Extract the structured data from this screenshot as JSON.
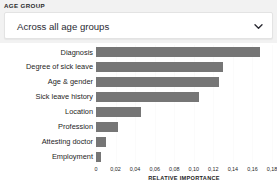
{
  "filter": {
    "label": "AGE GROUP",
    "selected": "Across all age groups",
    "icon": "chevron-down-icon"
  },
  "colors": {
    "bar": "#767676",
    "strip_background": "#f2f2f2",
    "plot_background": "#ffffff",
    "gridline": "#fbfbfb",
    "text": "#1e1e24"
  },
  "chart_data": {
    "type": "bar",
    "orientation": "horizontal",
    "title": "",
    "xlabel": "RELATIVE IMPORTANCE",
    "ylabel": "",
    "categories": [
      "Diagnosis",
      "Degree of sick leave",
      "Age & gender",
      "Sick leave history",
      "Location",
      "Profession",
      "Attesting doctor",
      "Employment"
    ],
    "values": [
      0.168,
      0.13,
      0.126,
      0.105,
      0.046,
      0.023,
      0.01,
      0.005
    ],
    "xlim": [
      0,
      0.18
    ],
    "xticks": [
      0,
      0.02,
      0.04,
      0.06,
      0.08,
      0.1,
      0.12,
      0.14,
      0.16,
      0.18
    ],
    "xticklabels": [
      "0",
      "0,02",
      "0,04",
      "0,06",
      "0,08",
      "0,10",
      "0,12",
      "0,14",
      "0,16",
      "0,18"
    ],
    "grid": true,
    "legend": false
  }
}
